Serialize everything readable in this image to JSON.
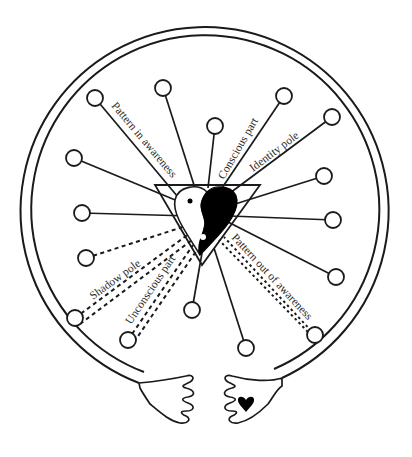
{
  "diagram": {
    "type": "symbolic-self-diagram",
    "colors": {
      "ink": "#1a1a1a",
      "background": "#ffffff",
      "label": "#2a2a2a"
    },
    "outer_ring": {
      "cx": 206,
      "cy": 210,
      "r_outer": 184,
      "r_inner": 174
    },
    "center_symbol": "yin-yang-heart-in-inverted-triangle",
    "labels": {
      "pattern_in_awareness": "Pattern in awareness",
      "conscious_part": "Conscious part",
      "identity_pole": "Identity pole",
      "shadow_pole": "Shadow pole",
      "unconscious_part": "Unconscious part",
      "pattern_out_of_awareness": "Pattern out of awareness"
    },
    "nodes": [
      {
        "id": 1,
        "x": 95,
        "y": 98,
        "line": "solid",
        "label": "Pattern in awareness"
      },
      {
        "id": 2,
        "x": 163,
        "y": 88,
        "line": "solid"
      },
      {
        "id": 3,
        "x": 215,
        "y": 126,
        "line": "solid"
      },
      {
        "id": 4,
        "x": 74,
        "y": 158,
        "line": "solid"
      },
      {
        "id": 5,
        "x": 284,
        "y": 96,
        "line": "solid",
        "label": "Conscious part"
      },
      {
        "id": 6,
        "x": 332,
        "y": 117,
        "line": "solid",
        "label": "Identity pole"
      },
      {
        "id": 7,
        "x": 324,
        "y": 176,
        "line": "solid"
      },
      {
        "id": 8,
        "x": 82,
        "y": 213,
        "line": "solid"
      },
      {
        "id": 9,
        "x": 333,
        "y": 220,
        "line": "solid"
      },
      {
        "id": 10,
        "x": 86,
        "y": 258,
        "line": "dashed"
      },
      {
        "id": 11,
        "x": 336,
        "y": 277,
        "line": "solid"
      },
      {
        "id": 12,
        "x": 75,
        "y": 318,
        "line": "dashed",
        "label": "Shadow pole"
      },
      {
        "id": 13,
        "x": 192,
        "y": 310,
        "line": "solid"
      },
      {
        "id": 14,
        "x": 128,
        "y": 340,
        "line": "dashed",
        "label": "Unconscious part"
      },
      {
        "id": 15,
        "x": 315,
        "y": 335,
        "line": "dotted",
        "label": "Pattern out of awareness"
      },
      {
        "id": 16,
        "x": 246,
        "y": 348,
        "line": "solid"
      }
    ],
    "hands": [
      {
        "side": "left",
        "marking": "none"
      },
      {
        "side": "right",
        "marking": "heart"
      }
    ]
  }
}
